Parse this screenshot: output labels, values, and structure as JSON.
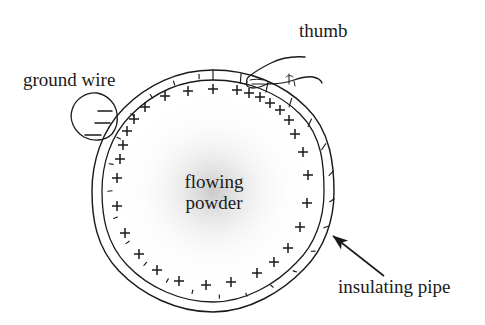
{
  "figure": {
    "type": "line-diagram",
    "background_color": "#ffffff",
    "ink_color": "#1a1a1a",
    "width": 485,
    "height": 325
  },
  "labels": {
    "thumb": "thumb",
    "ground_wire": "ground wire",
    "insulating_pipe": "insulating pipe",
    "flowing_powder_line1": "flowing",
    "flowing_powder_line2": "powder"
  },
  "diagram": {
    "pipe": {
      "name": "insulating-pipe-cross-section",
      "center_x": 213,
      "center_y": 191,
      "outer_radius": 121,
      "inner_radius": 111,
      "wall_hatch_count": 26,
      "stroke_color": "#1a1a1a",
      "stroke_width": 1.4
    },
    "powder_region": {
      "name": "flowing-powder-region",
      "center_x": 213,
      "center_y": 191,
      "radius": 108,
      "shading": "radial-gray-haze",
      "shade_color": "#c9c9c9"
    },
    "ground_wire": {
      "name": "ground-wire-circle",
      "center_x": 94,
      "center_y": 123,
      "radius": 24,
      "charge_sign": "−",
      "charge_count": 3,
      "minus_marks": [
        {
          "x": 104,
          "y": 111,
          "len": 11
        },
        {
          "x": 101,
          "y": 123,
          "len": 13
        },
        {
          "x": 92,
          "y": 135,
          "len": 15
        }
      ]
    },
    "thumb": {
      "name": "thumb-pressing-pipe",
      "contact_x": 262,
      "contact_y": 84,
      "description": "hand with thumb touching the outside of the pipe wall at upper right"
    },
    "callout_arrow": {
      "name": "insulating-pipe-callout-arrow",
      "tip_x": 330,
      "tip_y": 233,
      "tail_x": 384,
      "tail_y": 276,
      "head_length": 13,
      "head_width": 9
    },
    "charges": {
      "sign": "+",
      "count": 24,
      "mark_size": 11,
      "stroke_width": 1.5,
      "positions_deg_from_top_clockwise": [
        6,
        14,
        20,
        26,
        33,
        41,
        50,
        62,
        76,
        93,
        112,
        130,
        147,
        160,
        172,
        188,
        203,
        219,
        236,
        252,
        268,
        288,
        312,
        338
      ],
      "radius": 103
    }
  }
}
